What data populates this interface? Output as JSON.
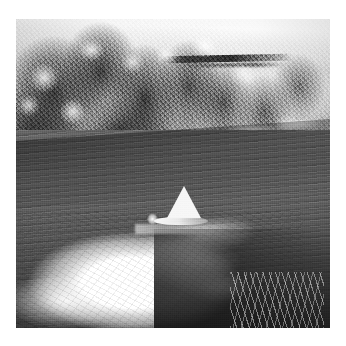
{
  "page": {
    "background_color": "#ffffff",
    "width": 346,
    "height": 346,
    "caption": ""
  },
  "photo": {
    "title": "River scene with small sailboat",
    "media": "black-and-white photograph",
    "frame": {
      "left": 16,
      "top": 19,
      "width": 314,
      "height": 309
    },
    "palette": {
      "paper_white": "#ffffff",
      "highlight": "#f5f5f2",
      "sail_white": "#f3f2ee",
      "water_mid_gray": "#5e5e5a",
      "water_dark": "#3f3f3b",
      "foliage_dark": "#22221f",
      "rock_light": "#e3e2de"
    },
    "regions": [
      {
        "name": "sky-and-bright-rock",
        "description": "Bright overexposed sky and sunlit rock haze across the very top edge"
      },
      {
        "name": "cliff-bluff",
        "description": "Light rocky bluff at upper right with a dark horizontal ledge line"
      },
      {
        "name": "bank-vegetation",
        "description": "Dense dark brush and trees covering the upper left and centre of the bank"
      },
      {
        "name": "shoreline",
        "description": "Bright sand and rock strip running diagonally from lower left to upper right"
      },
      {
        "name": "river-water",
        "description": "Mid-gray textured river water occupying the middle and lower frame"
      },
      {
        "name": "rapids-foam",
        "description": "Large white foaming rapids across the lower left and centre"
      },
      {
        "name": "grass-tufts",
        "description": "Sparse light grass tufts in the bottom right corner"
      }
    ],
    "subject": {
      "name": "sailboat",
      "description": "Small boat with a white triangular sail on the river",
      "sail_shape": "triangle",
      "sail_color": "#f3f2ee",
      "occupant": "single figure seated in the hull"
    }
  }
}
